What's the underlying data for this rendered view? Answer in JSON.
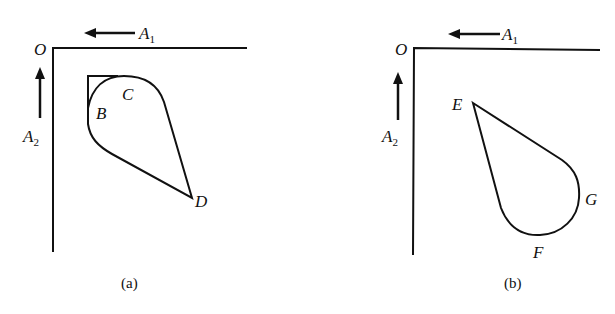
{
  "figure": {
    "panels": [
      {
        "caption": "(a)",
        "origin_label": "O",
        "axis1_label": "A",
        "axis1_sub": "1",
        "axis2_label": "A",
        "axis2_sub": "2",
        "point_labels": [
          "B",
          "C",
          "D"
        ]
      },
      {
        "caption": "(b)",
        "origin_label": "O",
        "axis1_label": "A",
        "axis1_sub": "1",
        "axis2_label": "A",
        "axis2_sub": "2",
        "point_labels": [
          "E",
          "G",
          "F"
        ]
      }
    ]
  },
  "colors": {
    "stroke": "#111111",
    "background": "#ffffff"
  }
}
